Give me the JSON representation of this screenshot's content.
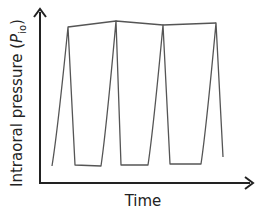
{
  "chart_data": {
    "type": "line",
    "title": "",
    "xlabel": "Time",
    "ylabel": "Intraoral pressure (P_io)",
    "ylabel_parts": {
      "prefix": "Intraoral pressure (",
      "symbol": "P",
      "subscript": "io",
      "suffix": ")"
    },
    "x_ticks": [],
    "y_ticks": [],
    "grid": false,
    "legend": null,
    "series": [
      {
        "name": "Intraoral pressure",
        "points": [
          [
            52,
            166
          ],
          [
            68,
            27
          ],
          [
            75,
            165
          ],
          [
            101,
            166
          ],
          [
            116,
            21
          ],
          [
            121,
            165
          ],
          [
            148,
            165
          ],
          [
            163,
            25
          ],
          [
            170,
            164
          ],
          [
            201,
            164
          ],
          [
            216,
            23
          ],
          [
            223,
            157
          ]
        ]
      },
      {
        "name": "Peak envelope",
        "points": [
          [
            68,
            27
          ],
          [
            116,
            21
          ],
          [
            163,
            25
          ],
          [
            216,
            23
          ]
        ]
      }
    ],
    "pixel_frame": {
      "origin": [
        40,
        183
      ],
      "x_axis_end": [
        253,
        183
      ],
      "y_axis_end": [
        40,
        8
      ]
    },
    "colors": {
      "axis": "#222222",
      "curve": "#555555"
    }
  },
  "labels": {
    "y_prefix": "Intraoral pressure (",
    "y_symbol": "P",
    "y_subscript": "io",
    "y_suffix": ")",
    "x": "Time"
  }
}
